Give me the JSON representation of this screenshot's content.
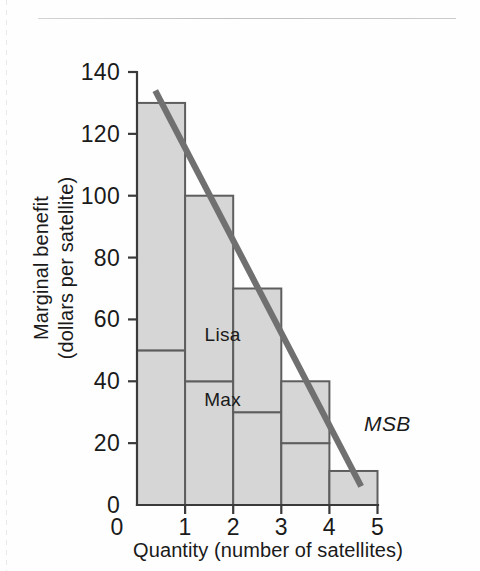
{
  "figure": {
    "background_color": "#fefefe",
    "rule_color": "#c2c2c2"
  },
  "chart_data": {
    "type": "bar",
    "title": "",
    "subtitle": "",
    "xlabel": "Quantity (number of satellites)",
    "ylabel": "Marginal benefit (dollars per satellite)",
    "ylabel_line1": "Marginal benefit",
    "ylabel_line2": "(dollars per satellite)",
    "xlim": [
      0,
      5
    ],
    "ylim": [
      0,
      140
    ],
    "xticks": [
      "0",
      "1",
      "2",
      "3",
      "4",
      "5"
    ],
    "xtick_values": [
      0,
      1,
      2,
      3,
      4,
      5
    ],
    "yticks": [
      "0",
      "20",
      "40",
      "60",
      "80",
      "100",
      "120",
      "140"
    ],
    "ytick_values": [
      0,
      20,
      40,
      60,
      80,
      100,
      120,
      140
    ],
    "grid": false,
    "legend_position": "inline-annotation",
    "categories": [
      "1",
      "2",
      "3",
      "4",
      "5"
    ],
    "bar_intervals": [
      [
        0,
        1
      ],
      [
        1,
        2
      ],
      [
        2,
        3
      ],
      [
        3,
        4
      ],
      [
        4,
        5
      ]
    ],
    "totals": [
      130,
      100,
      70,
      40,
      11
    ],
    "series": [
      {
        "name": "Max",
        "label": "Max",
        "values": [
          50,
          40,
          30,
          20,
          11
        ],
        "fill_color": "#d6d6d6",
        "edge_color": "#5e5e5e",
        "label_x": 1.78,
        "label_y": 32
      },
      {
        "name": "Lisa",
        "label": "Lisa",
        "values": [
          80,
          60,
          40,
          20,
          0
        ],
        "fill_color": "#d6d6d6",
        "edge_color": "#5e5e5e",
        "label_x": 1.78,
        "label_y": 53
      }
    ],
    "annotations": [
      {
        "name": "msb-curve",
        "label": "MSB",
        "style": "italic",
        "color": "#707070",
        "line_from": [
          0.38,
          134
        ],
        "line_to": [
          4.66,
          6
        ],
        "label_x": 4.72,
        "label_y": 24
      }
    ]
  }
}
